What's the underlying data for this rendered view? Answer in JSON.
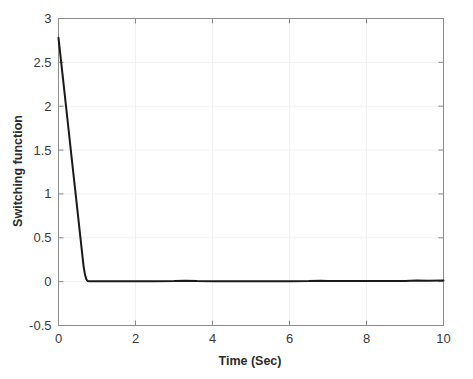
{
  "figure": {
    "background_color": "#ffffff",
    "axes_color": "#8c8c8c",
    "grid_color": "#f0f0f0",
    "line_color": "#1a1a1a",
    "tick_label_color": "#3a3a3a",
    "axis_title_color": "#2b2b2b"
  },
  "chart_data": {
    "type": "line",
    "title": "",
    "xlabel": "Time (Sec)",
    "ylabel": "Switching function",
    "xlim": [
      0,
      10
    ],
    "ylim": [
      -0.5,
      3
    ],
    "xticks": [
      0,
      2,
      4,
      6,
      8,
      10
    ],
    "xtick_labels": [
      "0",
      "2",
      "4",
      "6",
      "8",
      "10"
    ],
    "yticks": [
      -0.5,
      0,
      0.5,
      1,
      1.5,
      2,
      2.5,
      3
    ],
    "ytick_labels": [
      "-0.5",
      "0",
      "0.5",
      "1",
      "1.5",
      "2",
      "2.5",
      "3"
    ],
    "grid": true,
    "legend": null,
    "series": [
      {
        "name": "Switching function",
        "color": "#1a1a1a",
        "line_width": 2.0,
        "x": [
          0,
          0.05,
          0.1,
          0.15,
          0.2,
          0.25,
          0.3,
          0.35,
          0.4,
          0.45,
          0.5,
          0.55,
          0.6,
          0.65,
          0.68,
          0.7,
          0.72,
          0.74,
          0.76,
          0.8,
          0.9,
          1.0,
          1.2,
          1.5,
          2.0,
          2.5,
          3.0,
          3.3,
          3.6,
          4.0,
          4.5,
          5.0,
          5.5,
          6.0,
          6.5,
          6.8,
          7.0,
          7.5,
          8.0,
          8.5,
          9.0,
          9.3,
          9.6,
          10.0
        ],
        "y": [
          2.78,
          2.58,
          2.38,
          2.18,
          1.98,
          1.78,
          1.58,
          1.38,
          1.18,
          0.98,
          0.78,
          0.58,
          0.38,
          0.18,
          0.1,
          0.06,
          0.03,
          0.015,
          0.008,
          0.005,
          0.004,
          0.004,
          0.004,
          0.004,
          0.004,
          0.005,
          0.006,
          0.01,
          0.006,
          0.005,
          0.005,
          0.005,
          0.005,
          0.005,
          0.006,
          0.01,
          0.007,
          0.006,
          0.006,
          0.006,
          0.007,
          0.012,
          0.009,
          0.012
        ]
      }
    ],
    "annotations": []
  }
}
